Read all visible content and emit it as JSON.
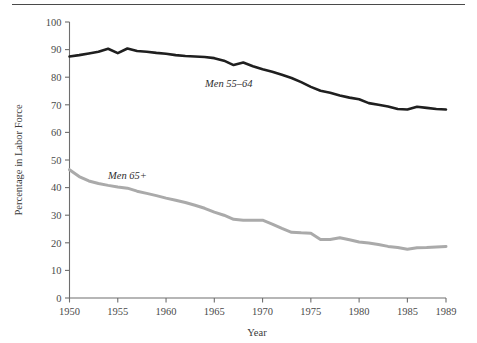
{
  "figure": {
    "has_top_rule": true,
    "background": "#ffffff"
  },
  "chart_data": {
    "type": "line",
    "title": "",
    "xlabel": "Year",
    "ylabel": "Percentage in Labor Force",
    "xlim": [
      1950,
      1989
    ],
    "ylim": [
      0,
      100
    ],
    "grid": false,
    "legend_position": "inline-annotation",
    "xticks": [
      1950,
      1955,
      1960,
      1965,
      1970,
      1975,
      1980,
      1985,
      1989
    ],
    "xtick_labels": [
      "1950",
      "1955",
      "1960",
      "1965",
      "1970",
      "1975",
      "1980",
      "1985",
      "1989"
    ],
    "yticks": [
      0,
      10,
      20,
      30,
      40,
      50,
      60,
      70,
      80,
      90,
      100
    ],
    "ytick_labels": [
      "0",
      "10",
      "20",
      "30",
      "40",
      "50",
      "60",
      "70",
      "80",
      "90",
      "100"
    ],
    "x": [
      1950,
      1951,
      1952,
      1953,
      1954,
      1955,
      1956,
      1957,
      1958,
      1959,
      1960,
      1961,
      1962,
      1963,
      1964,
      1965,
      1966,
      1967,
      1968,
      1969,
      1970,
      1971,
      1972,
      1973,
      1974,
      1975,
      1976,
      1977,
      1978,
      1979,
      1980,
      1981,
      1982,
      1983,
      1984,
      1985,
      1986,
      1987,
      1988,
      1989
    ],
    "series": [
      {
        "name": "Men 55–64",
        "color": "#1f1f1f",
        "width": 2.6,
        "label_x": 1966.5,
        "label_y": 76.5,
        "values": [
          87.5,
          88.0,
          88.6,
          89.2,
          90.3,
          88.7,
          90.4,
          89.5,
          89.2,
          88.8,
          88.5,
          88.0,
          87.7,
          87.5,
          87.3,
          86.9,
          86.0,
          84.4,
          85.3,
          84.0,
          82.9,
          82.0,
          80.9,
          79.7,
          78.2,
          76.5,
          75.1,
          74.4,
          73.4,
          72.6,
          72.0,
          70.6,
          70.0,
          69.4,
          68.5,
          68.3,
          69.3,
          68.9,
          68.5,
          68.3
        ]
      },
      {
        "name": "Men 65+",
        "color": "#aaaaaa",
        "width": 3.0,
        "label_x": 1956.0,
        "label_y": 43.0,
        "values": [
          46.5,
          44.0,
          42.4,
          41.5,
          40.8,
          40.2,
          39.8,
          38.7,
          37.9,
          37.1,
          36.2,
          35.4,
          34.6,
          33.6,
          32.5,
          31.1,
          30.0,
          28.5,
          28.2,
          28.2,
          28.2,
          26.8,
          25.2,
          23.8,
          23.6,
          23.5,
          21.2,
          21.2,
          21.8,
          21.1,
          20.3,
          19.9,
          19.4,
          18.7,
          18.3,
          17.7,
          18.2,
          18.3,
          18.5,
          18.7
        ]
      }
    ]
  }
}
